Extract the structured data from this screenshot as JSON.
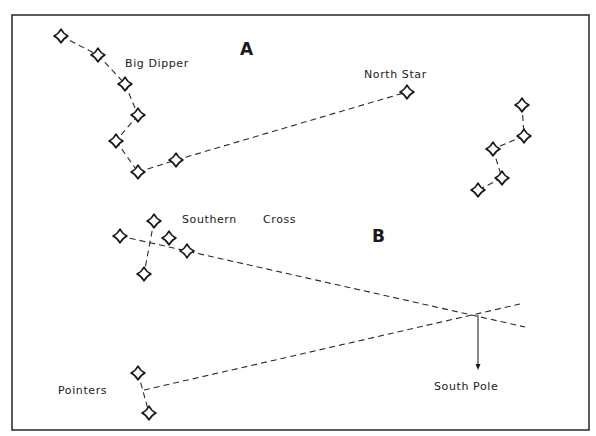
{
  "diagram": {
    "colors": {
      "ink": "#1a1a1a",
      "background": "#ffffff"
    },
    "frame": {
      "x": 12,
      "y": 15,
      "width": 577,
      "height": 415
    },
    "panels": [
      {
        "id": "A",
        "label": "A",
        "label_pos": [
          240,
          55
        ],
        "constellations": [
          {
            "name": "Big Dipper",
            "label": "Big Dipper",
            "label_pos": [
              125,
              67
            ],
            "stars": [
              [
                61,
                36
              ],
              [
                98,
                55
              ],
              [
                125,
                84
              ],
              [
                138,
                115
              ],
              [
                116,
                141
              ],
              [
                138,
                172
              ],
              [
                176,
                160
              ]
            ],
            "lines": [
              [
                [
                  61,
                  36
                ],
                [
                  98,
                  55
                ]
              ],
              [
                [
                  98,
                  55
                ],
                [
                  125,
                  84
                ]
              ],
              [
                [
                  125,
                  84
                ],
                [
                  138,
                  115
                ]
              ],
              [
                [
                  138,
                  115
                ],
                [
                  116,
                  141
                ]
              ],
              [
                [
                  116,
                  141
                ],
                [
                  138,
                  172
                ]
              ],
              [
                [
                  138,
                  172
                ],
                [
                  176,
                  160
                ]
              ]
            ]
          },
          {
            "name": "North Star",
            "label": "North Star",
            "label_pos": [
              364,
              78
            ],
            "stars": [
              [
                407,
                92
              ]
            ],
            "lines": [
              [
                [
                  176,
                  160
                ],
                [
                  407,
                  92
                ]
              ]
            ]
          },
          {
            "name": "Cassiopeia",
            "label": "",
            "stars": [
              [
                522,
                105
              ],
              [
                524,
                136
              ],
              [
                493,
                149
              ],
              [
                502,
                178
              ],
              [
                478,
                190
              ]
            ],
            "lines": [
              [
                [
                  522,
                  105
                ],
                [
                  524,
                  136
                ]
              ],
              [
                [
                  524,
                  136
                ],
                [
                  493,
                  149
                ]
              ],
              [
                [
                  493,
                  149
                ],
                [
                  502,
                  178
                ]
              ],
              [
                [
                  502,
                  178
                ],
                [
                  478,
                  190
                ]
              ]
            ]
          }
        ]
      },
      {
        "id": "B",
        "label": "B",
        "label_pos": [
          372,
          242
        ],
        "constellations": [
          {
            "name": "Southern Cross",
            "label_1": "Southern",
            "label_2": "Cross",
            "label_1_pos": [
              182,
              223
            ],
            "label_2_pos": [
              263,
              223
            ],
            "stars": [
              [
                154,
                221
              ],
              [
                120,
                236
              ],
              [
                169,
                238
              ],
              [
                187,
                251
              ],
              [
                144,
                274
              ]
            ],
            "lines": [
              [
                [
                  154,
                  221
                ],
                [
                  144,
                  274
                ]
              ],
              [
                [
                  120,
                  236
                ],
                [
                  525,
                  327
                ]
              ]
            ]
          },
          {
            "name": "Pointers",
            "label": "Pointers",
            "label_pos": [
              58,
              394
            ],
            "stars": [
              [
                138,
                373
              ],
              [
                149,
                413
              ]
            ],
            "lines": [
              [
                [
                  138,
                  373
                ],
                [
                  149,
                  413
                ]
              ],
              [
                [
                  144,
                  390
                ],
                [
                  520,
                  304
                ]
              ]
            ]
          }
        ],
        "south_pole": {
          "label": "South Pole",
          "label_pos": [
            434,
            390
          ],
          "intersection": [
            478,
            315
          ],
          "arrow_end": [
            478,
            370
          ]
        }
      }
    ]
  }
}
